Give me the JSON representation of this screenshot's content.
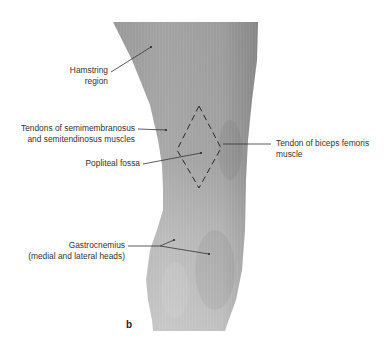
{
  "figure": {
    "panel_letter": "b",
    "colors": {
      "background": "#ffffff",
      "leg_dark": "#8f8f8f",
      "leg_mid": "#a6a6a6",
      "leg_light": "#c4c4c4",
      "leader_line": "#333333",
      "text": "#333333"
    }
  },
  "labels": {
    "hamstring": {
      "line1": "Hamstring",
      "line2": "region"
    },
    "tendons_semi": {
      "line1": "Tendons of semimembranosus",
      "line2": "and semitendinosus muscles"
    },
    "popliteal": {
      "line1": "Popliteal fossa"
    },
    "biceps": {
      "line1": "Tendon of biceps femoris",
      "line2": "muscle"
    },
    "gastrocnemius": {
      "line1": "Gastrocnemius",
      "line2": "(medial and lateral heads)"
    }
  }
}
